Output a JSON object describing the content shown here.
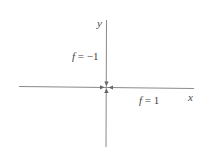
{
  "diagram": {
    "type": "coordinate-axes-with-level-curve-labels",
    "axes": {
      "x_label": "x",
      "y_label": "y"
    },
    "annotations": [
      {
        "id": "upper-left",
        "var": "f",
        "eq": " = ",
        "value": "−1"
      },
      {
        "id": "lower-right",
        "var": "f",
        "eq": " = ",
        "value": "1"
      }
    ],
    "origin_marker": "four arrows pointing inward to origin",
    "colors": {
      "axis": "#8a8a8a",
      "text": "#444444",
      "background": "#ffffff"
    }
  }
}
